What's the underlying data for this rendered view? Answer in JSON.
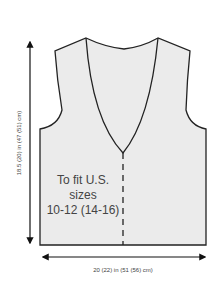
{
  "diagram": {
    "type": "knitting-schematic",
    "fit_label_lines": [
      "To fit U.S.",
      "sizes",
      "10-12 (14-16)"
    ],
    "height_label": "18.5 (20) in (47 (51) cm)",
    "width_label": "20 (22) in (51 (56) cm)",
    "colors": {
      "garment_fill": "#ebebeb",
      "outline": "#222222",
      "text": "#444444"
    }
  }
}
